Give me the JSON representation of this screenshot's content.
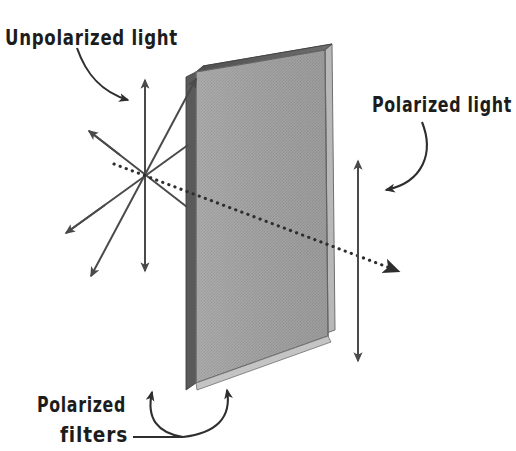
{
  "figure": {
    "background_color": "#ffffff",
    "width": 516,
    "height": 451
  },
  "labels": {
    "unpolarized": "Unpolarized light",
    "polarized": "Polarized light",
    "filters_line1": "Polarized",
    "filters_line2": "filters"
  },
  "colors": {
    "ink": "#1c1c1c",
    "stroke": "#4a4a4a",
    "panel_face_light": "#a8a8a8",
    "panel_face_dark": "#8e8e8e",
    "panel_edge_dark": "#5d5d5d",
    "panel_edge_darker": "#4a4a4a",
    "panel_top_edge": "#6b6b6b"
  },
  "geometry": {
    "burst_center_x": 145,
    "burst_center_y": 175,
    "panel_top_left_x": 196,
    "panel_top_left_y": 72,
    "panel_top_right_x": 325,
    "panel_top_right_y": 50,
    "panel_bottom_right_x": 328,
    "panel_bottom_right_y": 336,
    "panel_bottom_left_x": 196,
    "panel_bottom_left_y": 383,
    "vertical_arrow_x": 358,
    "vertical_arrow_top_y": 160,
    "vertical_arrow_bottom_y": 362
  },
  "rays": {
    "unpolarized_description": "Starburst of double-headed arrows representing randomly oriented electric field vectors of unpolarized light",
    "polarized_description": "Single vertical double-headed arrow representing light polarized in the vertical plane after passing through the filter",
    "beam_description": "Dotted arrow showing the propagation direction of the light beam through the filter"
  }
}
